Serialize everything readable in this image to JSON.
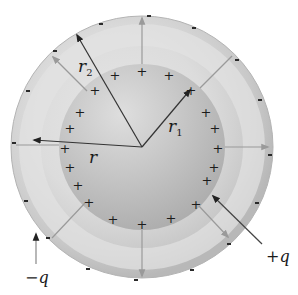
{
  "diagram": {
    "center": {
      "x": 142,
      "y": 147
    },
    "outer_sphere": {
      "radius": 131,
      "charge_label": "−q",
      "charge_sign": "-"
    },
    "inner_sphere": {
      "radius": 83,
      "charge_label": "+q",
      "charge_sign": "+"
    },
    "labels": {
      "r2": {
        "text": "r",
        "subscript": "2"
      },
      "r1": {
        "text": "r",
        "subscript": "1"
      },
      "r": {
        "text": "r"
      },
      "minus_q": "−q",
      "plus_q": "+q"
    },
    "colors": {
      "outer_shell": "#c4c4c4",
      "light_band": "#dcdcdc",
      "inner_sphere": "#b8b8b8",
      "inner_highlight": "#d6d6d6",
      "field_arrow": "#9a9a9a",
      "radius_arrow": "#333333"
    },
    "plus_count": 20,
    "minus_count": 16,
    "field_arrow_count": 8
  }
}
